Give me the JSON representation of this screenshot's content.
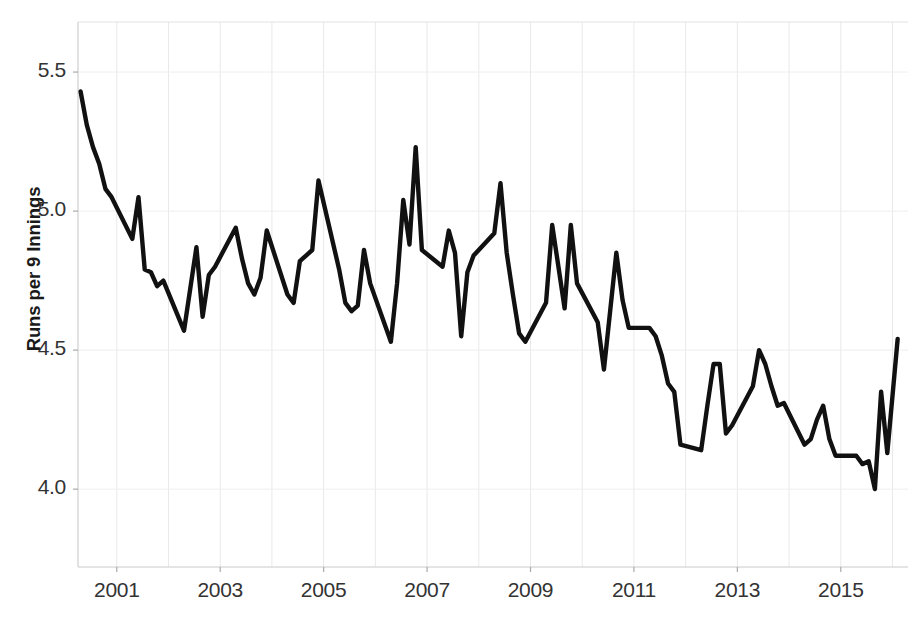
{
  "chart_data": {
    "type": "line",
    "title": "",
    "xlabel": "",
    "ylabel": "Runs per 9 Innings",
    "xlim": [
      2000.25,
      2016.3
    ],
    "ylim": [
      3.72,
      5.68
    ],
    "grid": true,
    "legend": "none",
    "line_color": "#111111",
    "line_width": 4.4,
    "x_tick_labels": [
      "2001",
      "2003",
      "2005",
      "2007",
      "2009",
      "2011",
      "2013",
      "2015"
    ],
    "x_tick_values": [
      2001,
      2003,
      2005,
      2007,
      2009,
      2011,
      2013,
      2015
    ],
    "y_tick_labels": [
      "4.0",
      "4.5",
      "5.0",
      "5.5"
    ],
    "y_tick_values": [
      4.0,
      4.5,
      5.0,
      5.5
    ],
    "series": [
      {
        "name": "Runs per 9 Innings",
        "x": [
          2000.3,
          2000.42,
          2000.54,
          2000.66,
          2000.78,
          2000.9,
          2001.3,
          2001.42,
          2001.54,
          2001.66,
          2001.78,
          2001.9,
          2002.3,
          2002.42,
          2002.54,
          2002.66,
          2002.78,
          2002.9,
          2003.3,
          2003.42,
          2003.54,
          2003.66,
          2003.78,
          2003.9,
          2004.3,
          2004.42,
          2004.54,
          2004.66,
          2004.78,
          2004.9,
          2005.3,
          2005.42,
          2005.54,
          2005.66,
          2005.78,
          2005.9,
          2006.3,
          2006.42,
          2006.54,
          2006.66,
          2006.78,
          2006.9,
          2007.3,
          2007.42,
          2007.54,
          2007.66,
          2007.78,
          2007.9,
          2008.3,
          2008.42,
          2008.54,
          2008.66,
          2008.78,
          2008.9,
          2009.3,
          2009.42,
          2009.54,
          2009.66,
          2009.78,
          2009.9,
          2010.3,
          2010.42,
          2010.54,
          2010.66,
          2010.78,
          2010.9,
          2011.3,
          2011.42,
          2011.54,
          2011.66,
          2011.78,
          2011.9,
          2012.3,
          2012.42,
          2012.54,
          2012.66,
          2012.78,
          2012.9,
          2013.3,
          2013.42,
          2013.54,
          2013.66,
          2013.78,
          2013.9,
          2014.3,
          2014.42,
          2014.54,
          2014.66,
          2014.78,
          2014.9,
          2015.3,
          2015.42,
          2015.54,
          2015.66,
          2015.78,
          2015.9,
          2016.1
        ],
        "values": [
          5.43,
          5.31,
          5.23,
          5.17,
          5.08,
          5.05,
          4.9,
          5.05,
          4.79,
          4.78,
          4.73,
          4.75,
          4.57,
          4.72,
          4.87,
          4.62,
          4.77,
          4.8,
          4.94,
          4.83,
          4.74,
          4.7,
          4.76,
          4.93,
          4.7,
          4.67,
          4.82,
          4.84,
          4.86,
          5.11,
          4.79,
          4.67,
          4.64,
          4.66,
          4.86,
          4.74,
          4.53,
          4.74,
          5.04,
          4.88,
          5.23,
          4.86,
          4.8,
          4.93,
          4.85,
          4.55,
          4.78,
          4.84,
          4.92,
          5.1,
          4.85,
          4.7,
          4.56,
          4.53,
          4.67,
          4.95,
          4.8,
          4.65,
          4.95,
          4.74,
          4.6,
          4.43,
          4.64,
          4.85,
          4.68,
          4.58,
          4.58,
          4.55,
          4.48,
          4.38,
          4.35,
          4.16,
          4.14,
          4.3,
          4.45,
          4.45,
          4.2,
          4.23,
          4.37,
          4.5,
          4.45,
          4.37,
          4.3,
          4.31,
          4.16,
          4.18,
          4.25,
          4.3,
          4.18,
          4.12,
          4.12,
          4.09,
          4.1,
          4.0,
          4.35,
          4.13,
          4.54
        ]
      }
    ]
  },
  "axes": {
    "y_title": "Runs per 9 Innings"
  }
}
